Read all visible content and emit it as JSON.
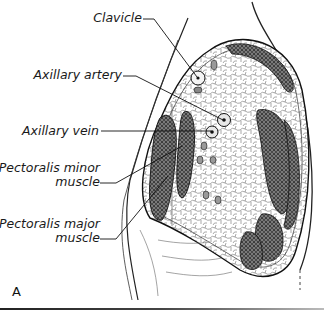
{
  "figure": {
    "panel_letter": "A",
    "labels": [
      {
        "id": "clavicle",
        "text": "Clavicle"
      },
      {
        "id": "axillary-artery",
        "text": "Axillary artery"
      },
      {
        "id": "axillary-vein",
        "text": "Axillary vein"
      },
      {
        "id": "pectoralis-minor",
        "line1": "Pectoralis minor",
        "line2": "muscle"
      },
      {
        "id": "pectoralis-major",
        "line1": "Pectoralis major",
        "line2": "muscle"
      }
    ],
    "colors": {
      "ink": "#1a1a1a",
      "muscle_fill": "#6a6a6a",
      "background": "#ffffff"
    }
  }
}
